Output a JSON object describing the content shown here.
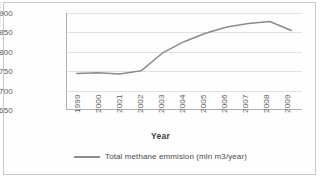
{
  "chart_data": {
    "type": "line",
    "title": "",
    "xlabel": "Year",
    "ylabel": "mln m3/year",
    "categories": [
      "1999",
      "2000",
      "2001",
      "2002",
      "2003",
      "2004",
      "2005",
      "2006",
      "2007",
      "2008",
      "2009"
    ],
    "values": [
      744,
      746,
      743,
      751,
      797,
      826,
      848,
      864,
      873,
      878,
      855
    ],
    "series": [
      {
        "name": "Total methane emmision (mln m3/year)",
        "values": [
          744,
          746,
          743,
          751,
          797,
          826,
          848,
          864,
          873,
          878,
          855
        ],
        "color": "#8b8b8b"
      }
    ],
    "ylim": [
      650,
      900
    ],
    "yticks": [
      650,
      700,
      750,
      800,
      850,
      900
    ],
    "ytick_labels": [
      "650",
      "700",
      "750",
      "800",
      "850",
      "900"
    ],
    "grid": true,
    "legend_position": "bottom",
    "legend": [
      "Total methane emmision (mln m3/year)"
    ]
  },
  "legend": {
    "entry_label": "Total methane emmision (mln m3/year)",
    "swatch_name": "line-swatch"
  },
  "colors": {
    "series_line": "#8b8b8b",
    "grid": "#e2e2e2",
    "axis": "#b0b0b0",
    "text": "#5d5d5d",
    "border": "#c9c9c9"
  }
}
